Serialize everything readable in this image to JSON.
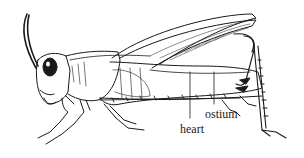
{
  "diagram": {
    "style": "black ink line drawing on white",
    "labels": [
      {
        "id": "heart",
        "text": "heart"
      },
      {
        "id": "ostium",
        "text": "ostium"
      }
    ],
    "colors": {
      "ink": "#1a1a1a",
      "background": "#ffffff"
    }
  }
}
